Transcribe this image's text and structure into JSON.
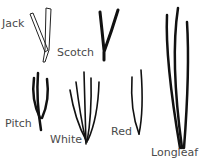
{
  "diagram": {
    "labels": [
      {
        "id": "jack",
        "text": "Jack"
      },
      {
        "id": "scotch",
        "text": "Scotch"
      },
      {
        "id": "pitch",
        "text": "Pitch"
      },
      {
        "id": "white",
        "text": "White"
      },
      {
        "id": "red",
        "text": "Red"
      },
      {
        "id": "longleaf",
        "text": "Longleaf"
      }
    ]
  }
}
